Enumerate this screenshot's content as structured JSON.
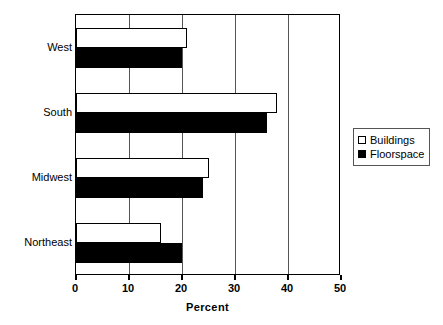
{
  "chart_data": {
    "type": "bar",
    "orientation": "horizontal",
    "title": "",
    "xlabel": "Percent",
    "ylabel": "",
    "xlim": [
      0,
      50
    ],
    "xticks": [
      0,
      10,
      20,
      30,
      40,
      50
    ],
    "xtick_labels": [
      "0",
      "10",
      "20",
      "30",
      "40",
      "50"
    ],
    "grid": true,
    "grid_axis": "x",
    "legend_position": "right",
    "categories": [
      "Northeast",
      "Midwest",
      "South",
      "West"
    ],
    "series": [
      {
        "name": "Buildings",
        "color": "#ffffff",
        "edge_color": "#000000",
        "values": [
          16,
          25,
          38,
          21
        ]
      },
      {
        "name": "Floorspace",
        "color": "#000000",
        "edge_color": "#000000",
        "values": [
          20,
          24,
          36,
          20
        ]
      }
    ]
  },
  "axis": {
    "x_title": "Percent",
    "ticks": [
      {
        "label": "0",
        "value": 0
      },
      {
        "label": "10",
        "value": 10
      },
      {
        "label": "20",
        "value": 20
      },
      {
        "label": "30",
        "value": 30
      },
      {
        "label": "40",
        "value": 40
      },
      {
        "label": "50",
        "value": 50
      }
    ]
  },
  "categories": [
    {
      "label": "West"
    },
    {
      "label": "South"
    },
    {
      "label": "Midwest"
    },
    {
      "label": "Northeast"
    }
  ],
  "legend": {
    "items": [
      {
        "label": "Buildings",
        "marker": "open-square-icon"
      },
      {
        "label": "Floorspace",
        "marker": "filled-square-icon"
      }
    ]
  }
}
